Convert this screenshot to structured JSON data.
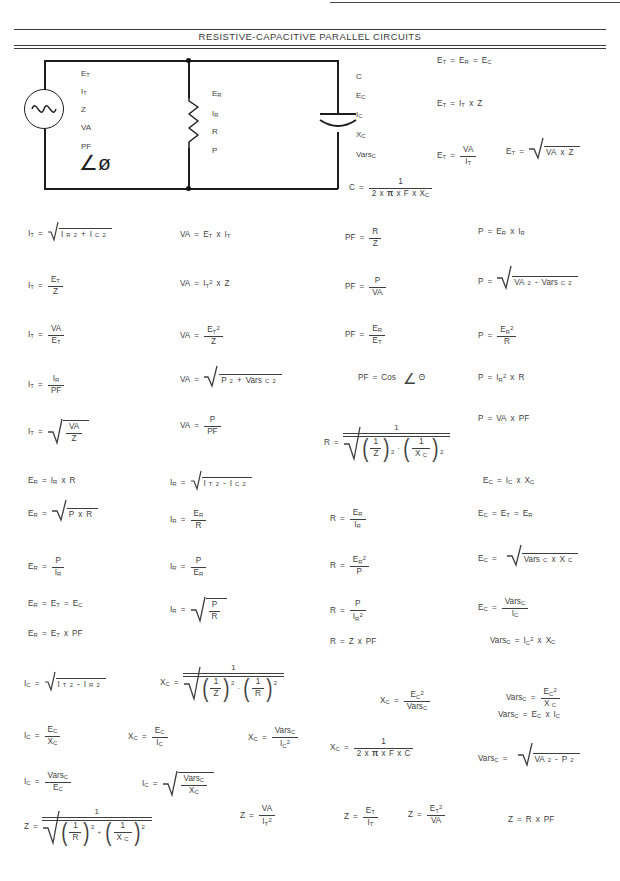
{
  "document": {
    "title": "RESISTIVE-CAPACITIVE PARALLEL CIRCUITS",
    "ink_color": "#3f3f3f",
    "line_color": "#1d1d1d"
  },
  "circuit": {
    "source_labels": [
      "E",
      "I",
      "Z",
      "VA",
      "PF"
    ],
    "source_subs": [
      "T",
      "T",
      "",
      "",
      ""
    ],
    "angle_symbol": "∠ø",
    "resistor_labels": [
      "E",
      "I",
      "R",
      "P"
    ],
    "resistor_subs": [
      "R",
      "R",
      "",
      ""
    ],
    "capacitor_labels": [
      "C",
      "E",
      "I",
      "X",
      "Vars"
    ],
    "capacitor_subs": [
      "",
      "C",
      "C",
      "C",
      "C"
    ],
    "source_symbol": "ac-sine-source",
    "resistor_symbol": "zigzag-resistor",
    "capacitor_symbol": "polarized-capacitor"
  },
  "formulas": {
    "et_1": "Eᴛ = Eʀ = Eᴄ",
    "et_2": "Eᴛ = Iᴛ x Z",
    "et_3": "Eᴛ = VA / Iᴛ",
    "et_4": "Eᴛ = √(VA x Z)",
    "cap_c": "C = 1 / (2 x π x F x Xᴄ)",
    "it_1": "Iᴛ = √(Iʀ² + Iᴄ²)",
    "it_2": "Iᴛ = Eᴛ / Z",
    "it_3": "Iᴛ = VA / Eᴛ",
    "it_4": "Iᴛ = Iʀ / PF",
    "it_5": "Iᴛ = √(VA / Z)",
    "va_1": "VA = Eᴛ x Iᴛ",
    "va_2": "VA = Iᴛ² x Z",
    "va_3": "VA = Eᴛ² / Z",
    "va_4": "VA = √(P² + Varsᴄ²)",
    "va_5": "VA = P / PF",
    "pf_1": "PF = R / Z",
    "pf_2": "PF = P / VA",
    "pf_3": "PF = Eʀ / Eᴛ",
    "pf_4": "PF = Cos ∠Θ",
    "p_1": "P = Eʀ x Iʀ",
    "p_2": "P = √(VA² - Varsᴄ²)",
    "p_3": "P = Eʀ² / R",
    "p_4": "P = Iʀ² x R",
    "p_5": "P = VA x PF",
    "er_1": "Eʀ = Iʀ x R",
    "er_2": "Eʀ = √(P x R)",
    "er_3": "Eʀ = P / Iʀ",
    "er_4": "Eʀ = Eᴛ = Eᴄ",
    "er_5": "Eʀ = Eᴛ x PF",
    "ir_1": "Iʀ = √(Iᴛ² - Iᴄ²)",
    "ir_2": "Iʀ = Eʀ / R",
    "ir_3": "Iʀ = P / Eʀ",
    "ir_4": "Iʀ = √(P / R)",
    "r_1": "R = 1 / √((1/Z)² - (1/Xᴄ)²)",
    "r_2": "R = Eʀ / Iʀ",
    "r_3": "R = Eʀ² / P",
    "r_4": "R = P / Iʀ²",
    "r_5": "R = Z x PF",
    "ec_1": "Eᴄ = Iᴄ x Xᴄ",
    "ec_2": "Eᴄ = Eᴛ = Eʀ",
    "ec_3": "Eᴄ = √(Varsᴄ x Xᴄ)",
    "ec_4": "Eᴄ = Varsᴄ / Iᴄ",
    "vc_0": "Varsᴄ = Iᴄ² x Xᴄ",
    "ic_1": "Iᴄ = √(Iᴛ² - Iʀ²)",
    "ic_2": "Iᴄ = Eᴄ / Xᴄ",
    "ic_3": "Iᴄ = Varsᴄ / Eᴄ",
    "ic_4": "Iᴄ = Varsᴄ / Iᴄ",
    "ic_5": "Iᴄ = √(Varsᴄ / Xᴄ)",
    "xc_1": "Xᴄ = 1 / √((1/Z)² - (1/R)²)",
    "xc_2": "Xᴄ = Eᴄ / Iᴄ",
    "xc_3": "Xᴄ = Varsᴄ / Iᴄ²",
    "xc_4": "Xᴄ = Eᴄ² / Varsᴄ",
    "xc_5": "Xᴄ = 1 / (2 x π x F x C)",
    "vc_1": "Varsᴄ = Eᴄ² / Xᴄ",
    "vc_2": "Varsᴄ = Eᴄ x Iᴄ",
    "vc_3": "Varsᴄ = √(VA² - P²)",
    "z_1": "Z = 1 / √((1/R)² + (1/Xᴄ)²)",
    "z_2": "Z = VA / Iᴛ²",
    "z_3": "Z = Eᴛ / Iᴛ",
    "z_4": "Z = Eᴛ² / VA",
    "z_5": "Z = R x PF"
  },
  "symbols": {
    "eq": "=",
    "times": "x",
    "plus": "+",
    "minus": "-",
    "one": "1",
    "two": "2",
    "pi": "π",
    "F": "F",
    "C": "C",
    "Z": "Z",
    "R": "R",
    "P": "P",
    "VA": "VA",
    "PF": "PF",
    "Cos": "Cos",
    "theta": "∠Θ",
    "E": "E",
    "I": "I",
    "X": "X",
    "Vars": "Vars",
    "sub_T": "T",
    "sub_R": "R",
    "sub_C": "C",
    "exp_2": "2"
  }
}
